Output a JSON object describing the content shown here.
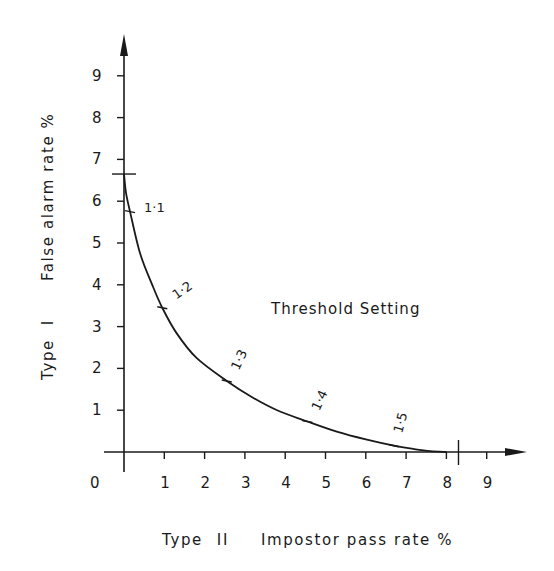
{
  "chart_data": {
    "type": "line",
    "title": "",
    "xlabel": "Type II   Impostor pass rate %",
    "ylabel": "Type I   False alarm rate %",
    "xlabel_parts": {
      "prefix": "Type",
      "numeral": "II",
      "text": "Impostor pass rate %"
    },
    "ylabel_parts": {
      "prefix": "Type",
      "numeral": "I",
      "text": "False alarm rate %"
    },
    "xlim": [
      0,
      9.5
    ],
    "ylim": [
      0,
      9.5
    ],
    "x_ticks": [
      1,
      2,
      3,
      4,
      5,
      6,
      7,
      8,
      9
    ],
    "x_tick_labels": [
      "1",
      "2",
      "3",
      "4",
      "5",
      "6",
      "7",
      "8",
      "9"
    ],
    "y_ticks": [
      1,
      2,
      3,
      4,
      5,
      6,
      7,
      8,
      9
    ],
    "y_tick_labels": [
      "1",
      "2",
      "3",
      "4",
      "5",
      "6",
      "7",
      "8",
      "9"
    ],
    "origin_label": "0",
    "grid": false,
    "legend": null,
    "annotations": [
      {
        "text": "Threshold Setting",
        "x": 4.6,
        "y": 3.4
      }
    ],
    "axis_intercept_marks": [
      {
        "axis": "y",
        "value": 6.65,
        "note": "curve intercept on Type I axis"
      },
      {
        "axis": "x",
        "value": 8.3,
        "note": "curve intercept on Type II axis"
      }
    ],
    "series": [
      {
        "name": "Threshold setting curve",
        "x": [
          0.0,
          0.05,
          0.15,
          0.4,
          0.7,
          0.95,
          1.3,
          1.8,
          2.55,
          3.2,
          3.8,
          4.55,
          5.3,
          6.0,
          6.7,
          7.2,
          7.6,
          8.0
        ],
        "y": [
          6.65,
          6.2,
          5.75,
          4.75,
          4.0,
          3.45,
          2.85,
          2.25,
          1.7,
          1.3,
          1.0,
          0.73,
          0.48,
          0.3,
          0.15,
          0.07,
          0.02,
          0.0
        ]
      }
    ],
    "labeled_points": [
      {
        "label": "1·1",
        "x": 0.15,
        "y": 5.75
      },
      {
        "label": "1·2",
        "x": 0.95,
        "y": 3.45
      },
      {
        "label": "1·3",
        "x": 2.55,
        "y": 1.7
      },
      {
        "label": "1·4",
        "x": 4.55,
        "y": 0.73
      },
      {
        "label": "1·5",
        "x": 6.7,
        "y": 0.15
      }
    ]
  }
}
